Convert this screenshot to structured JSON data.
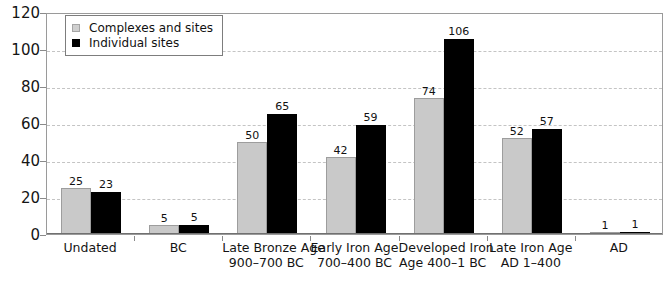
{
  "chart_data": {
    "type": "bar",
    "title": "",
    "subtitle": "",
    "xlabel": "",
    "ylabel": "",
    "ylim": [
      0,
      120
    ],
    "yticks": [
      0,
      20,
      40,
      60,
      80,
      100,
      120
    ],
    "grid": true,
    "legend_position": "top-left",
    "categories": [
      "Undated",
      "BC",
      "Late Bronze Age 900–700 BC",
      "Early Iron Age 700–400 BC",
      "Developed Iron Age 400–1 BC",
      "Late Iron Age AD 1–400",
      "AD"
    ],
    "category_lines": [
      [
        "Undated"
      ],
      [
        "BC"
      ],
      [
        "Late Bronze Age",
        "900–700 BC"
      ],
      [
        "Early Iron Age",
        "700–400 BC"
      ],
      [
        "Developed Iron",
        "Age 400–1 BC"
      ],
      [
        "Late Iron Age",
        "AD 1–400"
      ],
      [
        "AD"
      ]
    ],
    "series": [
      {
        "name": "Complexes and sites",
        "color": "#c9c9c9",
        "values": [
          25,
          5,
          50,
          42,
          74,
          52,
          1
        ]
      },
      {
        "name": "Individual sites",
        "color": "#000000",
        "values": [
          23,
          5,
          65,
          59,
          106,
          57,
          1
        ]
      }
    ]
  },
  "legend": {
    "items": [
      {
        "label": "Complexes and sites",
        "swatch": "series-a"
      },
      {
        "label": "Individual sites",
        "swatch": "series-b"
      }
    ]
  },
  "axis": {
    "y_tick_labels": [
      "120",
      "100",
      "80",
      "60",
      "40",
      "20",
      "0"
    ]
  }
}
